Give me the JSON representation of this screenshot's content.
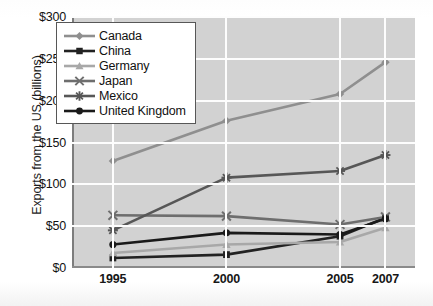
{
  "chart_data": {
    "type": "line",
    "title": "",
    "xlabel": "",
    "ylabel": "Exports from the US (billions)",
    "categories": [
      "1995",
      "2000",
      "2005",
      "2007"
    ],
    "x_positions": [
      1995,
      2000,
      2005,
      2007
    ],
    "xlim": [
      1993.2,
      2008.3
    ],
    "ylim": [
      0,
      300
    ],
    "ytick_labels": [
      "$0",
      "$50",
      "$100",
      "$150",
      "$200",
      "$250",
      "$300"
    ],
    "ytick_values": [
      0,
      50,
      100,
      150,
      200,
      250,
      300
    ],
    "grid": true,
    "legend_position": "upper-left",
    "series": [
      {
        "name": "Canada",
        "marker": "diamond",
        "color": "#8f8f8f",
        "values": [
          128,
          176,
          208,
          246
        ]
      },
      {
        "name": "China",
        "marker": "square",
        "color": "#222222",
        "values": [
          12,
          16,
          38,
          60
        ]
      },
      {
        "name": "Germany",
        "marker": "triangle",
        "color": "#a8a8a8",
        "values": [
          18,
          28,
          31,
          48
        ]
      },
      {
        "name": "Japan",
        "marker": "x",
        "color": "#6e6e6e",
        "values": [
          63,
          62,
          52,
          61
        ]
      },
      {
        "name": "Mexico",
        "marker": "asterisk",
        "color": "#575757",
        "values": [
          45,
          108,
          116,
          135
        ]
      },
      {
        "name": "United Kingdom",
        "marker": "circle",
        "color": "#1a1a1a",
        "values": [
          28,
          42,
          40,
          59
        ]
      }
    ]
  },
  "legend": {
    "entries": [
      "Canada",
      "China",
      "Germany",
      "Japan",
      "Mexico",
      "United Kingdom"
    ]
  },
  "axes": {
    "y_title": "Exports from the US (billions)",
    "y_ticks": [
      "$300",
      "$250",
      "$200",
      "$150",
      "$100",
      "$50",
      "$0"
    ],
    "x_ticks": [
      "1995",
      "2000",
      "2005",
      "2007"
    ]
  },
  "colors": {
    "plot_background": "#d2d2d2",
    "grid": "#fdfdfd",
    "page_background": "#ffffff",
    "axis": "#7d7d7d"
  }
}
